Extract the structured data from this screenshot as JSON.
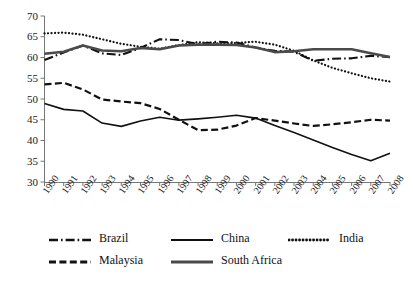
{
  "chart_data": {
    "type": "line",
    "title": "",
    "xlabel": "",
    "ylabel": "",
    "x": [
      "1990",
      "1991",
      "1992",
      "1993",
      "1994",
      "1995",
      "1996",
      "1997",
      "1998",
      "1999",
      "2000",
      "2001",
      "2002",
      "2003",
      "2004",
      "2005",
      "2006",
      "2007",
      "2008"
    ],
    "xlim": [
      "1990",
      "2008"
    ],
    "ylim": [
      30,
      70
    ],
    "yticks": [
      30,
      35,
      40,
      45,
      50,
      55,
      60,
      65,
      70
    ],
    "ytick_labels": [
      "30",
      "35",
      "40",
      "45",
      "50",
      "55",
      "60",
      "65",
      "70"
    ],
    "grid": false,
    "legend_position": "bottom",
    "series": [
      {
        "name": "Brazil",
        "style": "dash-dot",
        "color": "#111111",
        "width": 2.1,
        "values": [
          59.4,
          61.2,
          62.9,
          61.0,
          60.6,
          62.3,
          64.4,
          64.2,
          63.2,
          63.8,
          63.6,
          62.4,
          61.6,
          61.4,
          59.2,
          59.7,
          59.8,
          60.4,
          60.1
        ]
      },
      {
        "name": "China",
        "style": "solid",
        "color": "#111111",
        "width": 1.6,
        "values": [
          48.9,
          47.5,
          47.1,
          44.2,
          43.4,
          44.7,
          45.6,
          44.9,
          45.2,
          45.6,
          46.1,
          45.4,
          43.6,
          41.9,
          40.1,
          38.3,
          36.6,
          35.1,
          36.9
        ]
      },
      {
        "name": "India",
        "style": "dotted",
        "color": "#111111",
        "width": 2.2,
        "values": [
          65.8,
          66.0,
          65.5,
          64.4,
          63.3,
          62.6,
          62.1,
          63.0,
          63.7,
          63.4,
          63.5,
          63.8,
          63.1,
          61.6,
          59.3,
          57.5,
          56.2,
          55.0,
          54.2
        ]
      },
      {
        "name": "Malaysia",
        "style": "dashed",
        "color": "#111111",
        "width": 2.2,
        "values": [
          53.5,
          53.9,
          52.3,
          49.9,
          49.4,
          49.0,
          47.6,
          45.0,
          42.5,
          42.6,
          43.6,
          45.4,
          44.8,
          44.1,
          43.5,
          43.9,
          44.4,
          45.0,
          44.8
        ]
      },
      {
        "name": "South Africa",
        "style": "solid-thick",
        "color": "#4a4a4a",
        "width": 2.6,
        "values": [
          60.9,
          61.4,
          62.9,
          61.7,
          61.5,
          62.3,
          62.0,
          62.9,
          63.1,
          63.1,
          63.0,
          62.4,
          61.3,
          61.5,
          62.0,
          62.0,
          62.0,
          61.0,
          60.1
        ]
      }
    ]
  },
  "legend": {
    "items": [
      {
        "label": "Brazil"
      },
      {
        "label": "China"
      },
      {
        "label": "India"
      },
      {
        "label": "Malaysia"
      },
      {
        "label": "South Africa"
      }
    ]
  }
}
